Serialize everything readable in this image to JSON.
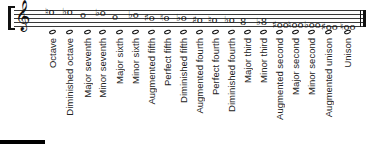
{
  "score": {
    "clef": "treble-clef",
    "clef_glyph": "𝄞",
    "final_barline": "double-bar-final"
  },
  "intervals": [
    {
      "label": "Octave",
      "upper": "♮o",
      "x": 49
    },
    {
      "label": "Diminished octave",
      "upper": "♭o",
      "x": 66
    },
    {
      "label": "Major seventh",
      "upper": "o",
      "x": 84
    },
    {
      "label": "Minor seventh",
      "upper": "♭o",
      "x": 99
    },
    {
      "label": "Major sixth",
      "upper": "o",
      "x": 116
    },
    {
      "label": "Minor sixth",
      "upper": "♭o",
      "x": 132
    },
    {
      "label": "Augmented fifth",
      "upper": "♯o",
      "x": 148
    },
    {
      "label": "Perfect fifth",
      "upper": "♮o",
      "x": 164
    },
    {
      "label": "Diminished fifth",
      "upper": "♭o",
      "x": 180
    },
    {
      "label": "Augmented fourth",
      "upper": "♯o",
      "x": 196
    },
    {
      "label": "Perfect fourth",
      "upper": "♮o",
      "x": 212
    },
    {
      "label": "Diminished fourth",
      "upper": "♭o",
      "x": 228
    },
    {
      "label": "Major third",
      "upper": "8",
      "x": 244
    },
    {
      "label": "Minor third",
      "upper": "♭8",
      "x": 260
    },
    {
      "label": "Augmented second",
      "upper": "♯oo",
      "x": 276
    },
    {
      "label": "Major second",
      "upper": "♮oo",
      "x": 292
    },
    {
      "label": "Minor second",
      "upper": "♭oo",
      "x": 308
    },
    {
      "label": "Augmented unison",
      "upper": "♯oo",
      "x": 325
    },
    {
      "label": "Unison",
      "upper": "♮oo",
      "x": 344
    }
  ],
  "colors": {
    "ink": "#111111",
    "staff": "#3a3a3a",
    "label": "#222222",
    "background": "#ffffff"
  }
}
